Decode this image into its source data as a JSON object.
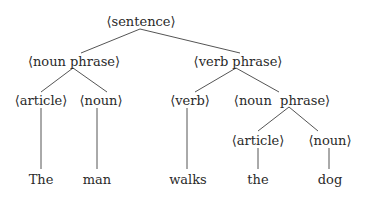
{
  "diagram": {
    "type": "parse-tree",
    "nodes": {
      "sentence": {
        "label": "⟨sentence⟩"
      },
      "np1": {
        "label": "⟨noun phrase⟩"
      },
      "vp": {
        "label": "⟨verb phrase⟩"
      },
      "art1": {
        "label": "⟨article⟩"
      },
      "noun1": {
        "label": "⟨noun⟩"
      },
      "verb": {
        "label": "⟨verb⟩"
      },
      "np2": {
        "label": "⟨noun  phrase⟩"
      },
      "art2": {
        "label": "⟨article⟩"
      },
      "noun2": {
        "label": "⟨noun⟩"
      }
    },
    "leaves": {
      "w1": {
        "label": "The"
      },
      "w2": {
        "label": "man"
      },
      "w3": {
        "label": "walks"
      },
      "w4": {
        "label": "the"
      },
      "w5": {
        "label": "dog"
      }
    },
    "edges": [
      [
        "sentence",
        "np1"
      ],
      [
        "sentence",
        "vp"
      ],
      [
        "np1",
        "art1"
      ],
      [
        "np1",
        "noun1"
      ],
      [
        "vp",
        "verb"
      ],
      [
        "vp",
        "np2"
      ],
      [
        "np2",
        "art2"
      ],
      [
        "np2",
        "noun2"
      ],
      [
        "art1",
        "w1"
      ],
      [
        "noun1",
        "w2"
      ],
      [
        "verb",
        "w3"
      ],
      [
        "art2",
        "w4"
      ],
      [
        "noun2",
        "w5"
      ]
    ],
    "line_color": "#555555",
    "text_color": "#2a2a2a"
  }
}
